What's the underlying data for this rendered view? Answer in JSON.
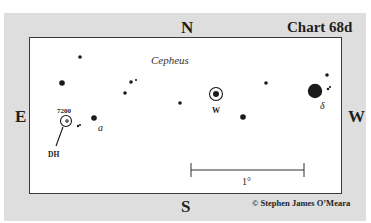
{
  "chart": {
    "title": "Chart 68d",
    "constellation": "Cepheus",
    "copyright": "© Stephen James O’Meara",
    "directions": {
      "north": "N",
      "south": "S",
      "east": "E",
      "west": "W"
    },
    "scale_bar_label": "1°",
    "labels": {
      "variable_w": "W",
      "delta": "δ",
      "alpha": "a",
      "ngc": "7200",
      "double_h": "DH"
    },
    "colors": {
      "panel": "#dedede",
      "chart_bg": "#ffffff",
      "ink": "#1e1e1e"
    }
  }
}
